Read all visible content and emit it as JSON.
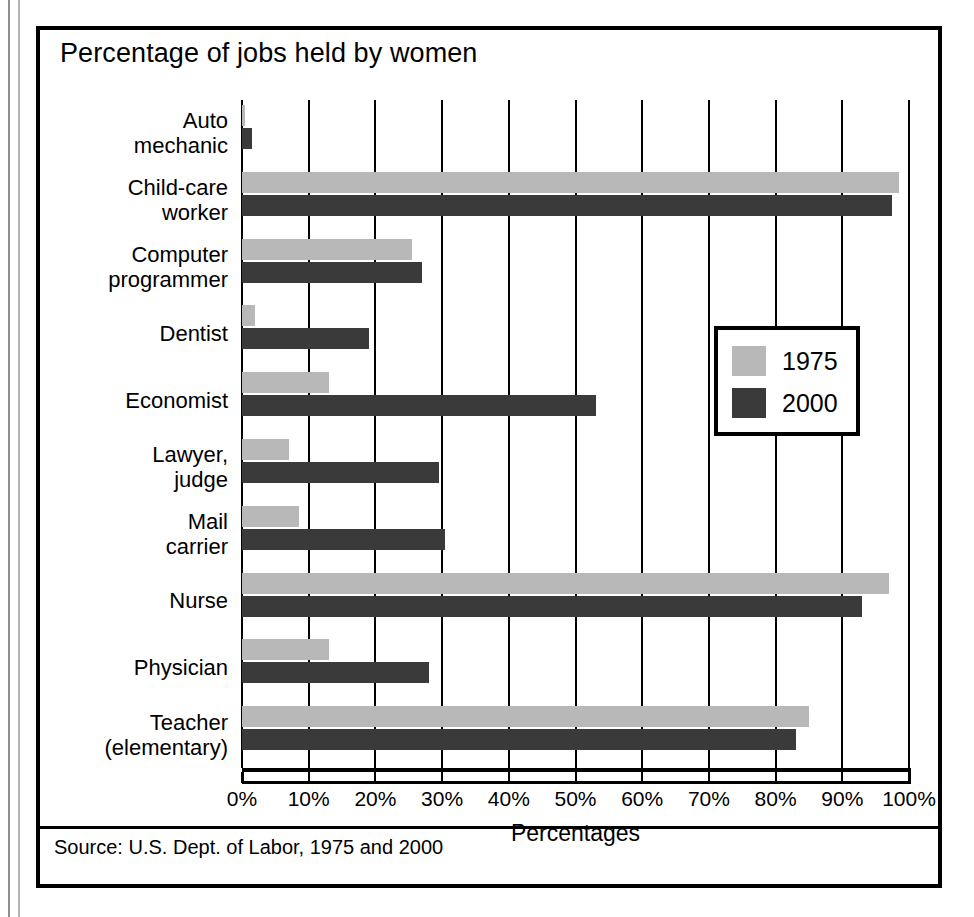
{
  "figure": {
    "title": "Percentage of jobs held by women",
    "source": "Source: U.S. Dept. of Labor, 1975 and 2000"
  },
  "legend": {
    "items": [
      {
        "label": "1975",
        "color": "#b8b8b8"
      },
      {
        "label": "2000",
        "color": "#3a3a3a"
      }
    ]
  },
  "axis": {
    "title": "Percentages",
    "ticks": [
      "0%",
      "10%",
      "20%",
      "30%",
      "40%",
      "50%",
      "60%",
      "70%",
      "80%",
      "90%",
      "100%"
    ]
  },
  "categories": [
    {
      "line1": "Auto",
      "line2": "mechanic"
    },
    {
      "line1": "Child-care",
      "line2": "worker"
    },
    {
      "line1": "Computer",
      "line2": "programmer"
    },
    {
      "line1": "Dentist",
      "line2": ""
    },
    {
      "line1": "Economist",
      "line2": ""
    },
    {
      "line1": "Lawyer,",
      "line2": "judge"
    },
    {
      "line1": "Mail",
      "line2": "carrier"
    },
    {
      "line1": "Nurse",
      "line2": ""
    },
    {
      "line1": "Physician",
      "line2": ""
    },
    {
      "line1": "Teacher",
      "line2": "(elementary)"
    }
  ],
  "chart_data": {
    "type": "bar",
    "orientation": "horizontal",
    "title": "Percentage of jobs held by women",
    "xlabel": "Percentages",
    "ylabel": "",
    "xlim": [
      0,
      100
    ],
    "xticks": [
      0,
      10,
      20,
      30,
      40,
      50,
      60,
      70,
      80,
      90,
      100
    ],
    "grid": true,
    "legend_position": "inside-right",
    "categories": [
      "Auto mechanic",
      "Child-care worker",
      "Computer programmer",
      "Dentist",
      "Economist",
      "Lawyer, judge",
      "Mail carrier",
      "Nurse",
      "Physician",
      "Teacher (elementary)"
    ],
    "series": [
      {
        "name": "1975",
        "color": "#b8b8b8",
        "values": [
          0.5,
          98.5,
          25.5,
          2,
          13,
          7,
          8.5,
          97,
          13,
          85
        ]
      },
      {
        "name": "2000",
        "color": "#3a3a3a",
        "values": [
          1.5,
          97.5,
          27,
          19,
          53,
          29.5,
          30.5,
          93,
          28,
          83
        ]
      }
    ],
    "source": "Source: U.S. Dept. of Labor, 1975 and 2000"
  }
}
